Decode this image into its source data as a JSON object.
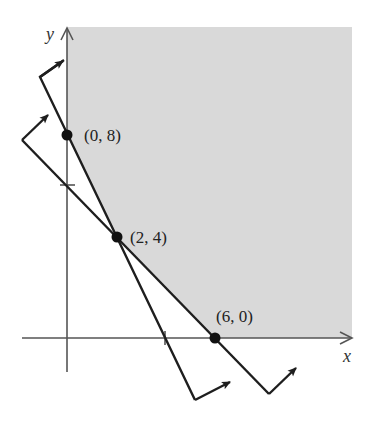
{
  "figure": {
    "type": "feasible-region-graph",
    "axes": {
      "x_label": "x",
      "y_label": "y"
    },
    "points": [
      {
        "label": "(0, 8)",
        "x": 0,
        "y": 8
      },
      {
        "label": "(2, 4)",
        "x": 2,
        "y": 4
      },
      {
        "label": "(6, 0)",
        "x": 6,
        "y": 0
      }
    ],
    "tick_marks": {
      "y_axis": [
        6,
        8
      ],
      "x_axis": [
        4,
        6
      ]
    },
    "boundary_lines": [
      {
        "name": "line-through-0-8-and-2-4",
        "passes_through": [
          "(0, 8)",
          "(2, 4)",
          "(4, 0)"
        ],
        "direction_arrow": "toward shaded side"
      },
      {
        "name": "line-through-2-4-and-6-0",
        "passes_through": [
          "(0, 6)",
          "(2, 4)",
          "(6, 0)"
        ],
        "direction_arrow": "toward shaded side"
      }
    ],
    "region": {
      "description": "unbounded feasible region shaded above both lines in first quadrant",
      "fill_color": "#d9d9d9"
    },
    "colors": {
      "line": "#1e1e1e",
      "axis": "#555555",
      "shade": "#d9d9d9"
    }
  }
}
